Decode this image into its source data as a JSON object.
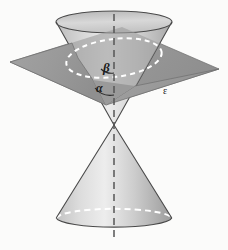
{
  "figure": {
    "background_color": "#fbfbfa",
    "labels": {
      "beta": "β",
      "alpha": "α",
      "plane": "ε"
    },
    "colors": {
      "plane_fill": "#9a9a9a",
      "plane_stroke": "#6f6f6f",
      "cone_light": "#e9e9e9",
      "cone_mid": "#c9c9c9",
      "cone_dark": "#9d9d9d",
      "outline": "#4a4a4a",
      "dashed_hidden": "#ffffff",
      "axis": "#555555",
      "label": "#1c1c1c"
    },
    "geometry": {
      "apex": {
        "x": 114,
        "y": 125
      },
      "axis": {
        "x": 114,
        "top_y": 12,
        "bottom_y": 240
      },
      "upper_rim": {
        "cx": 114,
        "cy": 22,
        "rx": 58,
        "ry": 11
      },
      "lower_rim": {
        "cx": 114,
        "cy": 218,
        "rx": 58,
        "ry": 10
      },
      "section_ellipse": {
        "cx": 114,
        "cy": 58,
        "rx": 48,
        "ry": 20,
        "rotation": -7
      },
      "plane_quad": [
        {
          "x": 10,
          "y": 62
        },
        {
          "x": 122,
          "y": 27
        },
        {
          "x": 219,
          "y": 69
        },
        {
          "x": 106,
          "y": 105
        }
      ]
    },
    "elements": {
      "upper_nappe": "upper-cone",
      "lower_nappe": "lower-cone",
      "cutting_plane": "cutting-plane",
      "conic_section": "ellipse-section",
      "axis_line": "cone-axis",
      "angle_beta": "angle-beta-arc",
      "angle_alpha": "angle-alpha-arc"
    }
  }
}
